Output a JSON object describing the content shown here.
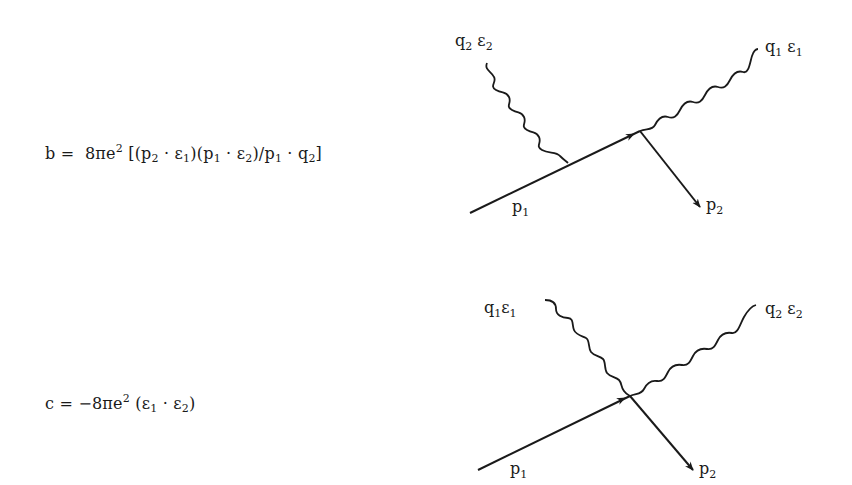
{
  "formulas": {
    "b": {
      "lhs": "b",
      "eq": "=",
      "coef": "8πe",
      "coef_exp": "2",
      "open": "[(p",
      "t1_sub": "2",
      "t1_dot": " · ε",
      "t1b_sub": "1",
      "mid": ")(p",
      "t2_sub": "1",
      "t2_dot": " · ε",
      "t2b_sub": "2",
      "div": ")/p",
      "t3_sub": "1",
      "t3_dot": " · q",
      "t3b_sub": "2",
      "close": "]"
    },
    "c": {
      "lhs": "c",
      "eq": "=",
      "coef": "−8πe",
      "coef_exp": "2",
      "open": "(ε",
      "t1_sub": "1",
      "dot": " · ε",
      "t2_sub": "2",
      "close": ")"
    }
  },
  "diagrams": {
    "top": {
      "photon_in_label": "q",
      "photon_in_label_sub": "2",
      "photon_in_pol": " ε",
      "photon_in_pol_sub": "2",
      "photon_out_label": "q",
      "photon_out_label_sub": "1",
      "photon_out_pol": " ε",
      "photon_out_pol_sub": "1",
      "electron_in_label": "p",
      "electron_in_sub": "1",
      "electron_out_label": "p",
      "electron_out_sub": "2"
    },
    "bottom": {
      "photon_in_label": "q",
      "photon_in_label_sub": "1",
      "photon_in_pol": "ε",
      "photon_in_pol_sub": "1",
      "photon_out_label": "q",
      "photon_out_label_sub": "2",
      "photon_out_pol": " ε",
      "photon_out_pol_sub": "2",
      "electron_in_label": "p",
      "electron_in_sub": "1",
      "electron_out_label": "p",
      "electron_out_sub": "2"
    }
  },
  "colors": {
    "ink": "#1a1a1a",
    "background": "#ffffff"
  }
}
